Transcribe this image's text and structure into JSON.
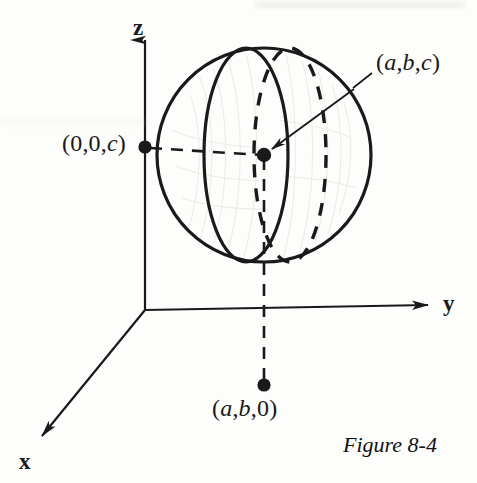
{
  "figure": {
    "caption": "Figure 8-4",
    "axes": {
      "x_label": "x",
      "y_label": "y",
      "z_label": "z"
    },
    "labels": {
      "point_abc": "(a,b,c)",
      "point_00c": "(0,0,c)",
      "point_ab0": "(a,b,0)"
    },
    "colors": {
      "ink": "#1a1a1a",
      "paper": "#fdfdfc",
      "pencil_shading": "#cdcdc8"
    }
  },
  "chart_data": {
    "type": "diagram",
    "title": "Figure 8-4",
    "axes": [
      {
        "name": "z",
        "label": "z",
        "direction": "up",
        "origin_px": [
          145,
          310
        ],
        "tip_px": [
          145,
          32
        ]
      },
      {
        "name": "y",
        "label": "y",
        "direction": "right",
        "origin_px": [
          145,
          310
        ],
        "tip_px": [
          428,
          305
        ]
      },
      {
        "name": "x",
        "label": "x",
        "direction": "down-left",
        "origin_px": [
          145,
          310
        ],
        "tip_px": [
          40,
          437
        ]
      }
    ],
    "sphere": {
      "center_px": [
        264,
        155
      ],
      "radius_px": 107,
      "front_meridian": "solid-ellipse",
      "back_meridian": "dashed-ellipse"
    },
    "points": [
      {
        "label": "(a,b,c)",
        "px": [
          264,
          155
        ],
        "marker": "filled-dot",
        "note": "center of sphere"
      },
      {
        "label": "(0,0,c)",
        "px": [
          145,
          147
        ],
        "marker": "filled-dot",
        "note": "on z-axis, height c"
      },
      {
        "label": "(a,b,0)",
        "px": [
          264,
          385
        ],
        "marker": "filled-dot",
        "note": "projection onto xy-plane"
      }
    ],
    "connectors": [
      {
        "from": "(0,0,c)",
        "to": "center",
        "style": "dashed"
      },
      {
        "from": "center",
        "to": "(a,b,0)",
        "style": "dashed"
      },
      {
        "from": "label (a,b,c)",
        "to": "center",
        "style": "solid-arrow"
      }
    ],
    "grid": false,
    "legend": null
  }
}
